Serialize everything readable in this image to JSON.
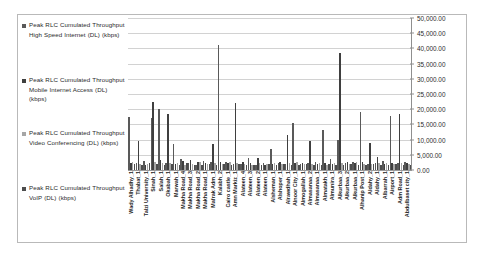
{
  "legend": {
    "position": "left",
    "items": [
      {
        "label": "Peak RLC Cumulated Throughput High Speed Internet (DL) (kbps)",
        "color": "#595959"
      },
      {
        "label": "Peak RLC Cumulated Throughput Mobile Internet Access (DL) (kbps)",
        "color": "#3f3f3f"
      },
      {
        "label": "Peak RLC Cumulated Throughput Video Conferencing (DL) (kbps)",
        "color": "#a6a6a6"
      },
      {
        "label": "Peak RLC Cumulated Throughput VoIP (DL) (kbps)",
        "color": "#4d4d4d"
      }
    ]
  },
  "chart_data": {
    "type": "bar",
    "title": "",
    "xlabel": "",
    "ylabel": "",
    "ylim": [
      0,
      50000
    ],
    "grid": true,
    "legend_position": "left",
    "yticks": [
      "0.00",
      "5,000.00",
      "10,000.00",
      "15,000.00",
      "20,000.00",
      "25,000.00",
      "30,000.00",
      "35,000.00",
      "40,000.00",
      "45,000.00",
      "50,000.00"
    ],
    "ytick_values": [
      0,
      5000,
      10000,
      15000,
      20000,
      25000,
      30000,
      35000,
      40000,
      45000,
      50000
    ],
    "categories": [
      "Wady Alhadhy_1",
      "Thabat_1",
      "Talzi University_1",
      "Sinah_1",
      "Salah_1",
      "Okabah_1",
      "Marwah_1",
      "Makha Road_4",
      "Makha Road_3",
      "Makha Road_2",
      "Makha Road_1",
      "Mafrak Adm_1",
      "Kalabh_2",
      "Cairo castle_1",
      "Amn Markiz_1",
      "Alateen_4",
      "Alateen_3",
      "Alateen_2",
      "Alateen_1",
      "Alsheman_1",
      "Alshoper_1",
      "Alrawdhah_1",
      "Alnoor City_1",
      "Almogallah_1",
      "Almasanaa_2",
      "Almasanaa_1",
      "Almatakh_1",
      "Almunira_1",
      "Alkurbaa_3",
      "Alkurbaa_2",
      "Alkurbaa_1",
      "Alhanip Post_1",
      "Aldahy_2",
      "Aldahy_1",
      "Albarrah_1",
      "Airport_1",
      "Adm Road_1",
      "Abdulbaset city_1"
    ],
    "series": [
      {
        "name": "Peak RLC Cumulated Throughput High Speed Internet (DL) (kbps)",
        "color": "#595959",
        "values": [
          17500,
          2200,
          3000,
          17000,
          20000,
          2400,
          8600,
          3500,
          2300,
          1800,
          3100,
          2600,
          41000,
          2500,
          2100,
          1900,
          4000,
          1700,
          2200,
          6900,
          2400,
          2000,
          15500,
          1900,
          2200,
          2700,
          13000,
          3600,
          9800,
          2300,
          2700,
          19000,
          2000,
          2300,
          3100,
          17800,
          2200,
          2600
        ]
      },
      {
        "name": "Peak RLC Cumulated Throughput Mobile Internet Access (DL) (kbps)",
        "color": "#3f3f3f",
        "values": [
          2200,
          9500,
          1700,
          22500,
          3400,
          18500,
          2100,
          2900,
          3300,
          2600,
          2200,
          8700,
          2800,
          2400,
          22000,
          2600,
          2300,
          3900,
          1800,
          2100,
          2500,
          11500,
          2400,
          2200,
          9700,
          2000,
          2400,
          1900,
          38500,
          2500,
          2200,
          2600,
          8900,
          4200,
          2100,
          2400,
          18500,
          2300
        ]
      },
      {
        "name": "Peak RLC Cumulated Throughput Video Conferencing (DL) (kbps)",
        "color": "#a6a6a6",
        "values": [
          2600,
          2100,
          1900,
          2500,
          2300,
          2200,
          2400,
          1800,
          2000,
          2600,
          1900,
          2300,
          2100,
          2500,
          2200,
          2000,
          1700,
          2400,
          2100,
          2300,
          1900,
          2200,
          2500,
          2000,
          2100,
          2400,
          1800,
          2200,
          2300,
          2000,
          2600,
          2100,
          1900,
          2400,
          2200,
          2000,
          2300,
          2100
        ]
      },
      {
        "name": "Peak RLC Cumulated Throughput VoIP (DL) (kbps)",
        "color": "#4d4d4d",
        "values": [
          2100,
          1600,
          2300,
          2000,
          1800,
          1900,
          1700,
          2200,
          1500,
          1800,
          2100,
          1600,
          1900,
          1700,
          2000,
          1500,
          1800,
          1600,
          1900,
          1700,
          2100,
          1500,
          1800,
          1900,
          1600,
          1700,
          2000,
          1800,
          1500,
          1900,
          1700,
          1600,
          2000,
          1800,
          1600,
          1900,
          1500,
          1700
        ]
      }
    ]
  }
}
